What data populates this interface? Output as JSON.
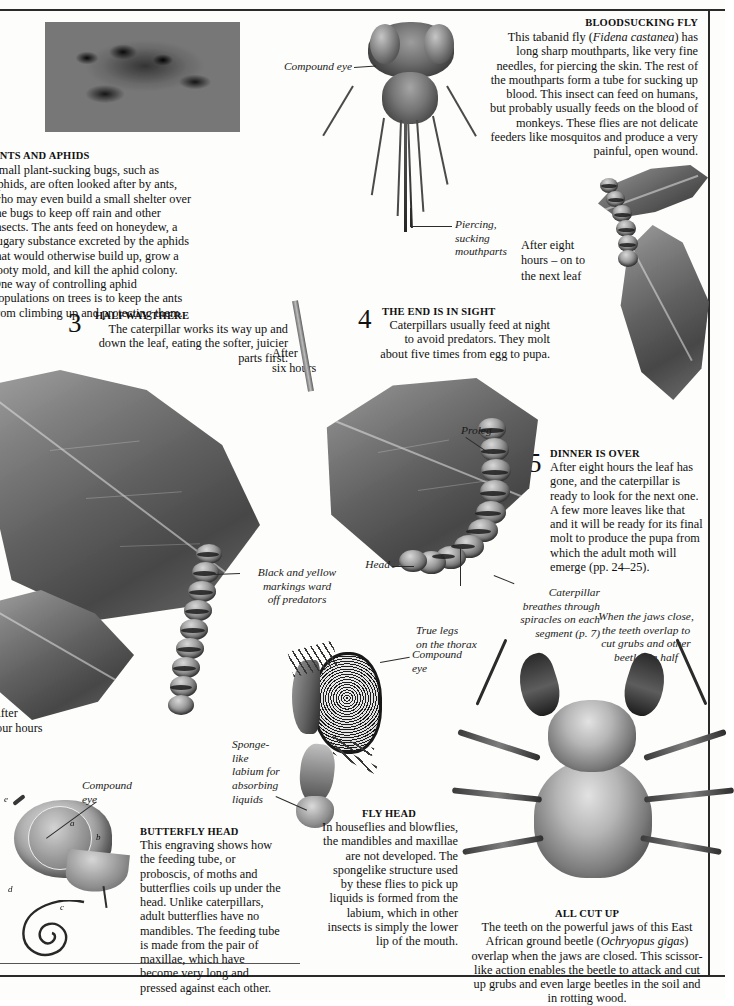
{
  "page": {
    "background_color": "#fdfdfb",
    "ink_color": "#111111"
  },
  "articles": {
    "ants_and_aphids": {
      "heading": "ANTS AND APHIDS",
      "body": "Small plant-sucking bugs, such as aphids, are often looked after by ants, who may even build a small shelter over the bugs to keep off rain and other insects. The ants feed on honeydew, a sugary substance excreted by the aphids that would otherwise build up, grow a sooty mold, and kill the aphid colony. One way of controlling aphid populations on trees is to keep the ants from climbing up and protecting them."
    },
    "bloodsucking_fly": {
      "heading": "BLOODSUCKING FLY",
      "body_part1": "This tabanid fly (",
      "species": "Fidena castanea",
      "body_part2": ") has long sharp mouthparts, like very fine needles, for piercing the skin. The rest of the mouthparts form a tube for sucking up blood. This insect can feed on humans, but probably usually feeds on the blood of monkeys. These flies are not delicate feeders like mosquitos and produce a very painful, open wound."
    },
    "butterfly_head": {
      "heading": "BUTTERFLY HEAD",
      "body": "This engraving shows how the feeding tube, or proboscis, of moths and butterflies coils up under the head. Unlike caterpillars, adult butterflies have no mandibles. The feeding tube is made from the pair of maxillae, which have become very long and pressed against each other."
    },
    "fly_head": {
      "heading": "FLY HEAD",
      "body": "In houseflies and blowflies, the mandibles and maxillae are not developed. The spongelike structure used by these flies to pick up liquids is formed from the labium, which in other insects is simply the lower lip of the mouth."
    },
    "all_cut_up": {
      "heading": "ALL CUT UP",
      "body_part1": "The teeth on the powerful jaws of this East African ground beetle (",
      "species": "Ochryopus gigas",
      "body_part2": ") overlap when the jaws are closed. This scissor-like action enables the beetle to attack and cut up grubs and even large beetles in the soil and in rotting wood."
    }
  },
  "steps": [
    {
      "number": "3",
      "heading": "HALFWAY THERE",
      "body": "The caterpillar works its way up and down the leaf, eating the softer, juicier parts first."
    },
    {
      "number": "4",
      "heading": "THE END IS IN SIGHT",
      "body": "Caterpillars usually feed at night to avoid predators. They molt about five times from egg to pupa."
    },
    {
      "number": "5",
      "heading": "DINNER IS OVER",
      "body": "After eight hours the leaf has gone, and the caterpillar is ready to look for the next one. A few more leaves like that and it will be ready for its final molt to produce the pupa from which the adult moth will emerge (pp. 24–25)."
    }
  ],
  "captions": {
    "compound_eye_fly": "Compound eye",
    "piercing_mouthparts": "Piercing,\nsucking\nmouthparts",
    "after_eight_hours": "After eight\nhours – on to\nthe next leaf",
    "after_six_hours": "After\nsix hours",
    "after_four_hours": "After\nfour hours",
    "proleg": "Proleg",
    "head": "Head",
    "black_yellow_markings": "Black and yellow\nmarkings ward\noff predators",
    "true_legs": "True legs\non the thorax",
    "spiracles": "Caterpillar\nbreathes through\nspiracles on each\nsegment (p. 7)",
    "jaws_close": "When the jaws close,\nthe teeth overlap to\ncut grubs and other\nbeetles in half",
    "compound_eye_butterfly": "Compound\neye",
    "compound_eye_flyhead": "Compound\neye",
    "sponge_labium": "Sponge-\nlike\nlabium for\nabsorbing\nliquids"
  },
  "engraving_keys": [
    "a",
    "b",
    "c",
    "d",
    "e"
  ]
}
